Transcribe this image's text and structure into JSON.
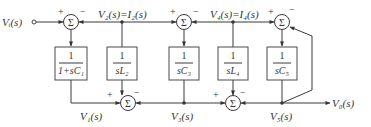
{
  "diagram": {
    "title": "",
    "input_label": "V_i(s)",
    "output_label": "V_o(s)",
    "summing_symbol": "Σ",
    "top_signals": {
      "node2": "V₂(s)=I₂(s)",
      "node4": "V₄(s)=I₄(s)"
    },
    "bottom_signals": {
      "v1": "V₁(s)",
      "v3": "V₃(s)",
      "v5": "V₅(s)",
      "vo": "V₀(s)"
    },
    "input_text": "Vᵢ(s)",
    "blocks": [
      {
        "id": "block-1",
        "numerator": "1",
        "denominator": "1+sC₁"
      },
      {
        "id": "block-2",
        "numerator": "1",
        "denominator": "sL₂"
      },
      {
        "id": "block-3",
        "numerator": "1",
        "denominator": "sC₃"
      },
      {
        "id": "block-4",
        "numerator": "1",
        "denominator": "sL₄"
      },
      {
        "id": "block-5",
        "numerator": "1",
        "denominator": "sC₅"
      }
    ],
    "top_sums": [
      {
        "id": "sum-top-1",
        "plus": "+",
        "minus": "−"
      },
      {
        "id": "sum-top-2",
        "plus": "+",
        "minus": "−"
      },
      {
        "id": "sum-top-3",
        "plus": "+",
        "minus": "−"
      }
    ],
    "bottom_sums": [
      {
        "id": "sum-bottom-1",
        "plus": "+",
        "minus": "−"
      },
      {
        "id": "sum-bottom-2",
        "plus": "+",
        "minus": "−"
      }
    ]
  }
}
